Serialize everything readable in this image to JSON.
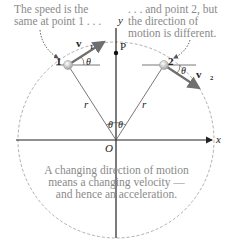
{
  "captions": {
    "left": [
      "The speed is the",
      "same at point 1 . . ."
    ],
    "right": [
      ". . . and point 2, but",
      "the direction of",
      "motion is different."
    ],
    "bottom": [
      "A changing direction of motion",
      "means a changing velocity —",
      "and hence an acceleration."
    ]
  },
  "labels": {
    "y_axis": "y",
    "x_axis": "x",
    "origin": "O",
    "point_p": "P",
    "point_1": "1",
    "point_2": "2",
    "radius_left": "r",
    "radius_right": "r",
    "theta": "θ",
    "v1": "v⃗₁",
    "v2": "v⃗₂"
  },
  "colors": {
    "caption": "#8a8a8a",
    "circle": "#9a9a9a",
    "vector": "#6f6f6f",
    "axis": "#222222"
  }
}
